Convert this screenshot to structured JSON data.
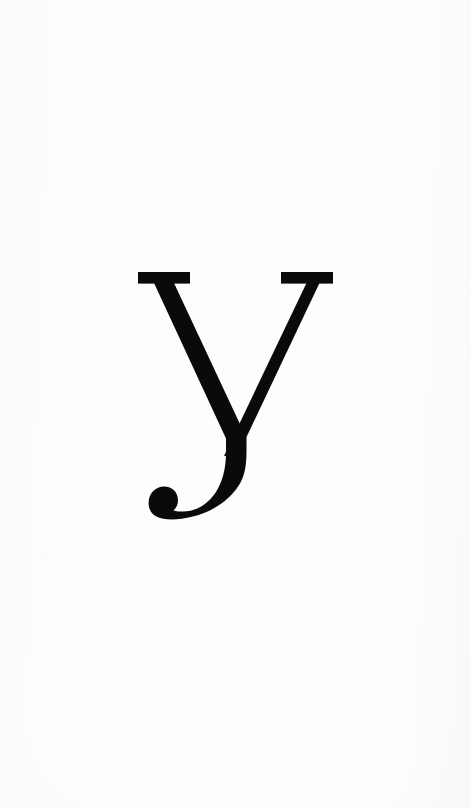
{
  "page": {
    "width": 471,
    "height": 808,
    "background_color": "#fdfdfd",
    "kind": "scanned-page-single-character"
  },
  "glyph": {
    "character": "y",
    "name": "latin-small-letter-y",
    "description": "Lowercase letter y set in a high-contrast modern serif typeface",
    "style": "Didone / Modern serif",
    "color": "#0a0a0a",
    "features": {
      "top_serifs": "flat slab serifs on both arms",
      "stroke_contrast": "high",
      "descender": "curved tail sweeping left",
      "terminal": "ball terminal"
    },
    "metrics": {
      "bbox_left": 138,
      "bbox_top": 272,
      "bbox_right": 333,
      "bbox_bottom": 520,
      "cap_line_y": 272,
      "serif_height": 11,
      "left_serif_left": 138,
      "left_serif_right": 190,
      "right_serif_left": 281,
      "right_serif_right": 333,
      "vertex_x": 225,
      "vertex_y": 428,
      "thick_stroke_width": 20,
      "thin_stroke_width": 13,
      "ball_center_x": 163,
      "ball_center_y": 503,
      "ball_radius": 16
    }
  }
}
